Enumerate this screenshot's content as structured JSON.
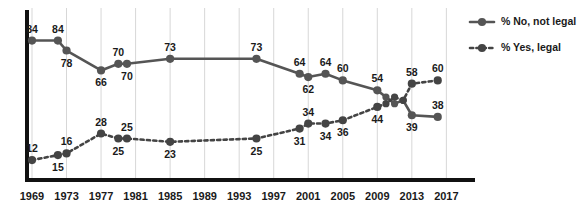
{
  "chart_data": {
    "type": "line",
    "title": "",
    "subtitle": "",
    "xlabel": "",
    "ylabel": "",
    "xlim": [
      1969,
      2018
    ],
    "ylim": [
      0,
      100
    ],
    "grid": "vertical",
    "legend_position": "right",
    "tick_labels_x": [
      "1969",
      "1973",
      "1977",
      "1981",
      "1985",
      "1989",
      "1993",
      "1997",
      "2001",
      "2005",
      "2009",
      "2013",
      "2017"
    ],
    "tick_values_x": [
      1969,
      1973,
      1977,
      1981,
      1985,
      1989,
      1993,
      1997,
      2001,
      2005,
      2009,
      2013,
      2017
    ],
    "series": [
      {
        "name": "% No, not legal",
        "style": "solid",
        "color": "#555555",
        "x": [
          1969,
          1972,
          1973,
          1977,
          1979,
          1980,
          1985,
          1995,
          2000,
          2001,
          2003,
          2005,
          2009,
          2010,
          2011,
          2012,
          2013,
          2016
        ],
        "values": [
          84,
          84,
          78,
          66,
          70,
          70,
          73,
          73,
          64,
          62,
          64,
          60,
          54,
          50,
          46,
          48,
          39,
          38
        ],
        "labeled_points": [
          {
            "x": 1969,
            "value": 84,
            "label": "84",
            "pos": "above"
          },
          {
            "x": 1972,
            "value": 84,
            "label": "84",
            "pos": "above"
          },
          {
            "x": 1973,
            "value": 78,
            "label": "78",
            "pos": "below"
          },
          {
            "x": 1977,
            "value": 66,
            "label": "66",
            "pos": "below"
          },
          {
            "x": 1979,
            "value": 70,
            "label": "70",
            "pos": "above"
          },
          {
            "x": 1980,
            "value": 70,
            "label": "70",
            "pos": "below"
          },
          {
            "x": 1985,
            "value": 73,
            "label": "73",
            "pos": "above"
          },
          {
            "x": 1995,
            "value": 73,
            "label": "73",
            "pos": "above"
          },
          {
            "x": 2000,
            "value": 64,
            "label": "64",
            "pos": "above"
          },
          {
            "x": 2001,
            "value": 62,
            "label": "62",
            "pos": "below"
          },
          {
            "x": 2003,
            "value": 64,
            "label": "64",
            "pos": "above"
          },
          {
            "x": 2005,
            "value": 60,
            "label": "60",
            "pos": "above"
          },
          {
            "x": 2009,
            "value": 54,
            "label": "54",
            "pos": "above"
          },
          {
            "x": 2013,
            "value": 39,
            "label": "39",
            "pos": "below"
          },
          {
            "x": 2016,
            "value": 38,
            "label": "38",
            "pos": "above"
          }
        ]
      },
      {
        "name": "% Yes, legal",
        "style": "dashed",
        "color": "#444444",
        "x": [
          1969,
          1972,
          1973,
          1977,
          1979,
          1980,
          1985,
          1995,
          2000,
          2001,
          2003,
          2005,
          2009,
          2010,
          2011,
          2012,
          2013,
          2016
        ],
        "values": [
          12,
          15,
          16,
          28,
          25,
          25,
          23,
          25,
          31,
          34,
          34,
          36,
          44,
          46,
          50,
          48,
          58,
          60
        ],
        "labeled_points": [
          {
            "x": 1969,
            "value": 12,
            "label": "12",
            "pos": "above"
          },
          {
            "x": 1972,
            "value": 15,
            "label": "15",
            "pos": "below"
          },
          {
            "x": 1973,
            "value": 16,
            "label": "16",
            "pos": "above"
          },
          {
            "x": 1977,
            "value": 28,
            "label": "28",
            "pos": "above"
          },
          {
            "x": 1979,
            "value": 25,
            "label": "25",
            "pos": "below"
          },
          {
            "x": 1980,
            "value": 25,
            "label": "25",
            "pos": "above"
          },
          {
            "x": 1985,
            "value": 23,
            "label": "23",
            "pos": "below"
          },
          {
            "x": 1995,
            "value": 25,
            "label": "25",
            "pos": "below"
          },
          {
            "x": 2000,
            "value": 31,
            "label": "31",
            "pos": "below"
          },
          {
            "x": 2001,
            "value": 34,
            "label": "34",
            "pos": "above"
          },
          {
            "x": 2003,
            "value": 34,
            "label": "34",
            "pos": "below"
          },
          {
            "x": 2005,
            "value": 36,
            "label": "36",
            "pos": "below"
          },
          {
            "x": 2009,
            "value": 44,
            "label": "44",
            "pos": "below"
          },
          {
            "x": 2013,
            "value": 58,
            "label": "58",
            "pos": "above"
          },
          {
            "x": 2016,
            "value": 60,
            "label": "60",
            "pos": "above"
          }
        ]
      }
    ]
  },
  "legend": {
    "items": [
      {
        "label": "% No, not legal",
        "style": "solid"
      },
      {
        "label": "% Yes, legal",
        "style": "dashed"
      }
    ]
  },
  "colors": {
    "series_no": "#555555",
    "series_yes": "#444444",
    "axis": "#111111",
    "gridline": "#d7d7d7",
    "text": "#1a1a1a",
    "background": "#ffffff"
  }
}
